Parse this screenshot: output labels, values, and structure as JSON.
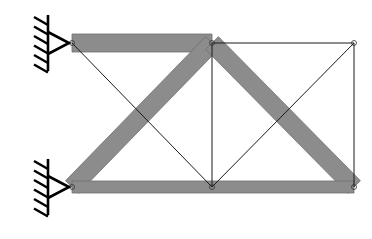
{
  "diagram": {
    "colors": {
      "background": "#ffffff",
      "thick_member": "#8c8c8c",
      "thick_member_edge": "#6e6e6e",
      "thin_member": "#1a1a1a",
      "support": "#000000"
    },
    "nodes": [
      {
        "id": "n1",
        "x": 72,
        "y": 43
      },
      {
        "id": "n2",
        "x": 212,
        "y": 43
      },
      {
        "id": "n3",
        "x": 354,
        "y": 43
      },
      {
        "id": "n4",
        "x": 72,
        "y": 187
      },
      {
        "id": "n5",
        "x": 212,
        "y": 187
      },
      {
        "id": "n6",
        "x": 354,
        "y": 187
      }
    ],
    "thick_members": [
      {
        "from": "n1",
        "to": "n2",
        "width": 18
      },
      {
        "from": "n4",
        "to": "n2",
        "width": 18
      },
      {
        "from": "n2",
        "to": "n6",
        "width": 18
      },
      {
        "from": "n4",
        "to": "n6",
        "width": 12
      }
    ],
    "thin_members": [
      {
        "from": "n2",
        "to": "n3"
      },
      {
        "from": "n3",
        "to": "n6"
      },
      {
        "from": "n2",
        "to": "n5"
      },
      {
        "from": "n1",
        "to": "n5"
      },
      {
        "from": "n5",
        "to": "n3"
      }
    ],
    "supports": [
      {
        "node": "n1",
        "type": "pin",
        "side": "left"
      },
      {
        "node": "n4",
        "type": "pin",
        "side": "left"
      }
    ]
  }
}
